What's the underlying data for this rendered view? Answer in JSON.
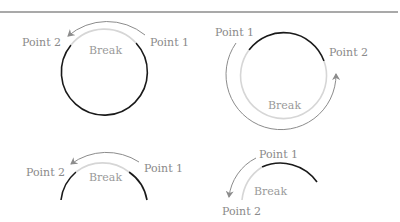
{
  "colors": {
    "rule": "#555555",
    "arc": "#1a1a1a",
    "break_arc": "#d0d0d0",
    "arrow": "#8c8c8c",
    "text": "#8a8a8a"
  },
  "panels": [
    {
      "id": "full-circle-short-break",
      "point1": "Point 1",
      "point2": "Point 2",
      "break": "Break"
    },
    {
      "id": "full-circle-long-break",
      "point1": "Point 1",
      "point2": "Point 2",
      "break": "Break"
    },
    {
      "id": "half-arc-short-break",
      "point1": "Point 1",
      "point2": "Point 2",
      "break": "Break"
    },
    {
      "id": "partial-arc-break",
      "point1": "Point 1",
      "point2": "Point 2",
      "break": "Break"
    }
  ]
}
